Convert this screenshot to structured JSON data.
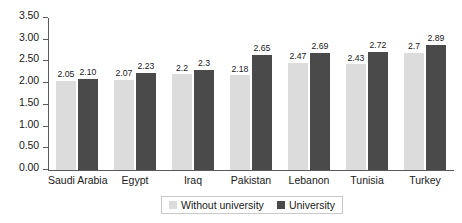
{
  "chart_data": {
    "type": "bar",
    "title": "",
    "subtitle": "",
    "xlabel": "",
    "ylabel": "",
    "ylim": [
      0,
      3.5
    ],
    "ytick_labels": [
      "0.00",
      "0.50",
      "1.00",
      "1.50",
      "2.00",
      "2.50",
      "3.00",
      "3.50"
    ],
    "ytick_values": [
      0,
      0.5,
      1.0,
      1.5,
      2.0,
      2.5,
      3.0,
      3.5
    ],
    "grid": false,
    "legend_position": "bottom",
    "categories": [
      "Saudi Arabia",
      "Egypt",
      "Iraq",
      "Pakistan",
      "Lebanon",
      "Tunisia",
      "Turkey"
    ],
    "series": [
      {
        "name": "Without university",
        "color": "#dcdcdc",
        "values": [
          2.05,
          2.07,
          2.2,
          2.18,
          2.47,
          2.43,
          2.7
        ],
        "labels": [
          "2.05",
          "2.07",
          "2.2",
          "2.18",
          "2.47",
          "2.43",
          "2.7"
        ]
      },
      {
        "name": "University",
        "color": "#4a4a4a",
        "values": [
          2.1,
          2.23,
          2.3,
          2.65,
          2.69,
          2.72,
          2.89
        ],
        "labels": [
          "2.10",
          "2.23",
          "2.3",
          "2.65",
          "2.69",
          "2.72",
          "2.89"
        ]
      }
    ]
  },
  "legend": {
    "items": [
      {
        "label": "Without university",
        "swatch": "without"
      },
      {
        "label": "University",
        "swatch": "with"
      }
    ]
  },
  "colors": {
    "without_university": "#dcdcdc",
    "university": "#4a4a4a",
    "axis": "#5a5a5a",
    "text": "#1a1a1a",
    "background": "#ffffff"
  }
}
